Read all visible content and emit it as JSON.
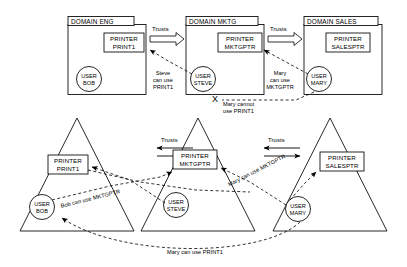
{
  "diagram": {
    "title_row": {
      "domains": [
        {
          "id": "eng",
          "name": "DOMAIN ENG",
          "printer": [
            "PRINTER",
            "PRINT1"
          ],
          "user": [
            "USER",
            "BOB"
          ]
        },
        {
          "id": "mktg",
          "name": "DOMAIN MKTG",
          "printer": [
            "PRINTER",
            "MKTGPTR"
          ],
          "user": [
            "USER",
            "STEVE"
          ]
        },
        {
          "id": "sales",
          "name": "DOMAIN SALES",
          "printer": [
            "PRINTER",
            "SALESPTR"
          ],
          "user": [
            "USER",
            "MARY"
          ]
        }
      ],
      "trust_labels": [
        "Trusts",
        "Trusts"
      ],
      "notes": [
        {
          "id": "steve-print1",
          "lines": [
            "Steve",
            "can use",
            "PRINT1"
          ]
        },
        {
          "id": "mary-mktgptr",
          "lines": [
            "Mary",
            "can use",
            "MKTGPTR"
          ]
        },
        {
          "id": "mary-cannot-print1",
          "lines": [
            "Mary cannot",
            "use PRINT1"
          ],
          "marker": "X"
        }
      ]
    },
    "triangle_row": {
      "domains": [
        {
          "id": "eng-tri",
          "printer": [
            "PRINTER",
            "PRINT1"
          ],
          "user": [
            "USER",
            "BOB"
          ]
        },
        {
          "id": "mktg-tri",
          "printer": [
            "PRINTER",
            "MKTGPTR"
          ],
          "user": [
            "USER",
            "STEVE"
          ]
        },
        {
          "id": "sales-tri",
          "printer": [
            "PRINTER",
            "SALESPTR"
          ],
          "user": [
            "USER",
            "MARY"
          ]
        }
      ],
      "trust_labels": [
        "Trusts",
        "Trusts"
      ],
      "notes": [
        {
          "id": "bob-mktgptr",
          "text": "Bob can use MKTGPTR"
        },
        {
          "id": "mary-mktgptr-2",
          "text": "Mary can use MKTGPTR"
        },
        {
          "id": "mary-print1",
          "text": "Mary can use PRINT1"
        }
      ]
    },
    "colors": {
      "stroke": "#000000",
      "background": "#ffffff",
      "fill": "#ffffff"
    }
  }
}
